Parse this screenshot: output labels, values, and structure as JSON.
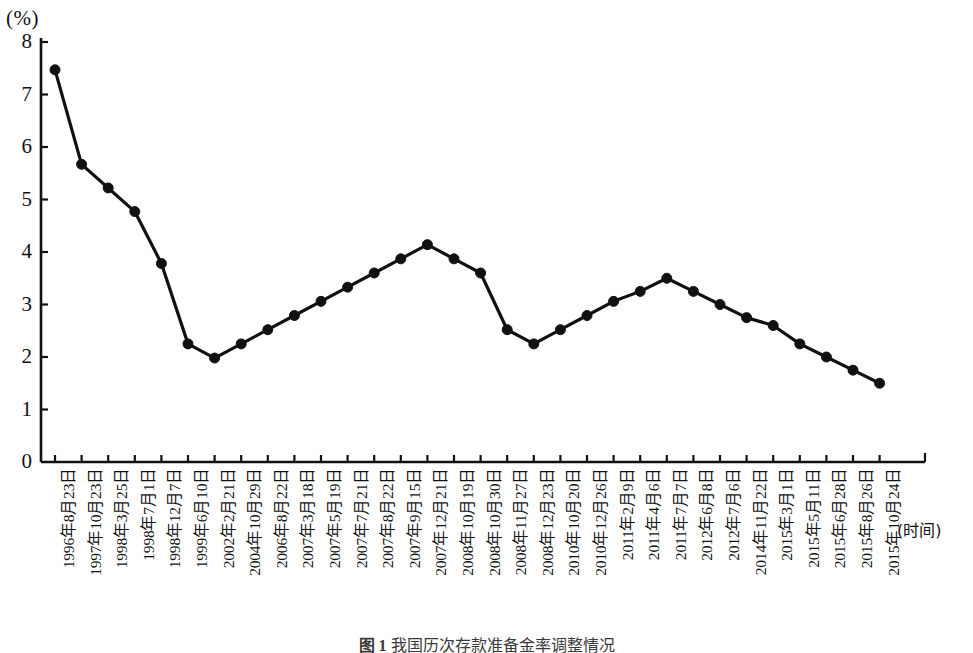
{
  "axes": {
    "unit_label": "(%)",
    "x_axis_name": "(时间)",
    "y_ticks": [
      "0",
      "1",
      "2",
      "3",
      "4",
      "5",
      "6",
      "7",
      "8"
    ],
    "y_min": 0,
    "y_max": 8
  },
  "caption": {
    "figure_number": "图 1",
    "text": "我国历次存款准备金率调整情况"
  },
  "style": {
    "line_color": "#111111",
    "marker_color": "#111111",
    "axis_color": "#111111",
    "background": "#ffffff"
  },
  "chart_data": {
    "type": "line",
    "title": "",
    "subtitle": "",
    "xlabel": "(时间)",
    "ylabel": "(%)",
    "ylim": [
      0,
      8
    ],
    "grid": false,
    "legend": "none",
    "marker": "filled-circle",
    "categories": [
      "1996年8月23日",
      "1997年10月23日",
      "1998年3月25日",
      "1998年7月1日",
      "1998年12月7日",
      "1999年6月10日",
      "2002年2月21日",
      "2004年10月29日",
      "2006年8月22日",
      "2007年3月18日",
      "2007年5月19日",
      "2007年7月21日",
      "2007年8月22日",
      "2007年9月15日",
      "2007年12月21日",
      "2008年10月19日",
      "2008年10月30日",
      "2008年11月27日",
      "2008年12月23日",
      "2010年10月20日",
      "2010年12月26日",
      "2011年2月9日",
      "2011年4月6日",
      "2011年7月7日",
      "2012年6月8日",
      "2012年7月6日",
      "2014年11月22日",
      "2015年3月1日",
      "2015年5月11日",
      "2015年6月28日",
      "2015年8月26日",
      "2015年10月24日"
    ],
    "values": [
      7.47,
      5.67,
      5.22,
      4.77,
      3.78,
      2.25,
      1.98,
      2.25,
      2.52,
      2.79,
      3.06,
      3.33,
      3.6,
      3.87,
      4.14,
      3.87,
      3.6,
      2.52,
      2.25,
      2.52,
      2.79,
      3.06,
      3.25,
      3.5,
      3.25,
      3.0,
      2.75,
      2.6,
      2.25,
      2.0,
      1.75,
      1.5
    ]
  }
}
